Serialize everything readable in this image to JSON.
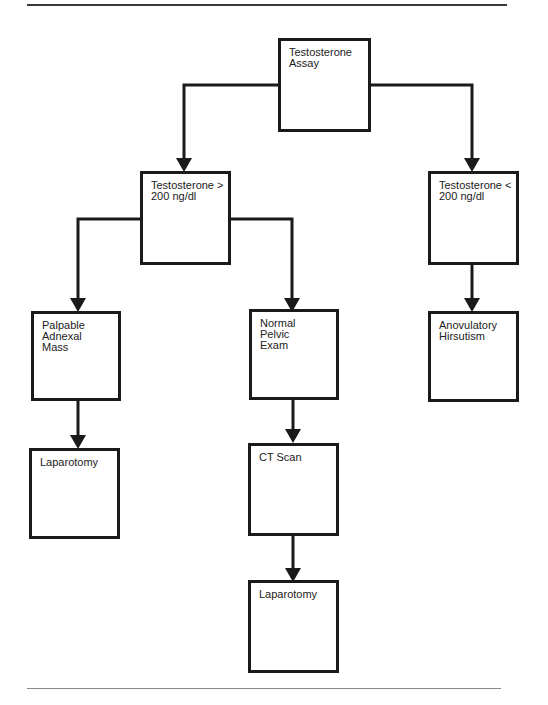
{
  "diagram": {
    "type": "flowchart",
    "nodes": [
      {
        "id": "assay",
        "label": "Testosterone\nAssay"
      },
      {
        "id": "high",
        "label": "Testosterone >\n200 ng/dl"
      },
      {
        "id": "low",
        "label": "Testosterone <\n200 ng/dl"
      },
      {
        "id": "mass",
        "label": "Palpable\nAdnexal\nMass"
      },
      {
        "id": "normal",
        "label": "Normal\nPelvic\nExam"
      },
      {
        "id": "anovulatory",
        "label": "Anovulatory\nHirsutism"
      },
      {
        "id": "lap1",
        "label": "Laparotomy"
      },
      {
        "id": "ct",
        "label": "CT Scan"
      },
      {
        "id": "lap2",
        "label": "Laparotomy"
      }
    ],
    "edges": [
      {
        "from": "assay",
        "to": "high"
      },
      {
        "from": "assay",
        "to": "low"
      },
      {
        "from": "high",
        "to": "mass"
      },
      {
        "from": "high",
        "to": "normal"
      },
      {
        "from": "low",
        "to": "anovulatory"
      },
      {
        "from": "mass",
        "to": "lap1"
      },
      {
        "from": "normal",
        "to": "ct"
      },
      {
        "from": "ct",
        "to": "lap2"
      }
    ]
  }
}
